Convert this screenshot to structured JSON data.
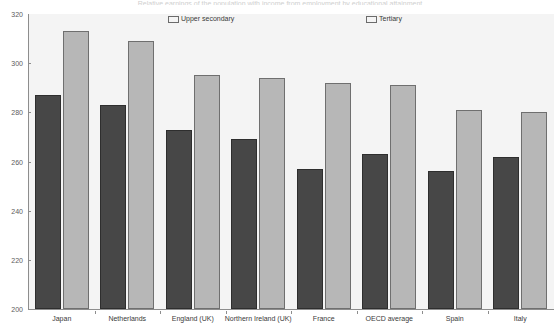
{
  "chart": {
    "title": "Relative earnings of the population with income from employment by educational attainment",
    "legend_position": "top",
    "y_axis": {
      "min": 200,
      "max": 320,
      "step": 20,
      "ticks": [
        200,
        220,
        240,
        260,
        280,
        300,
        320
      ]
    },
    "series_colors": {
      "upper_secondary": "#474747",
      "tertiary": "#b7b7b7"
    },
    "plot_background": "#f4f4f4",
    "axis_color": "#8d8d8d"
  },
  "legend": {
    "items": [
      {
        "label": "Upper secondary",
        "color": "#474747"
      },
      {
        "label": "Tertiary",
        "color": "#b7b7b7"
      }
    ]
  },
  "chart_data": {
    "type": "bar",
    "title": "Relative earnings of the population with income from employment by educational attainment",
    "xlabel": "",
    "ylabel": "",
    "ylim": [
      200,
      320
    ],
    "yticks": [
      200,
      220,
      240,
      260,
      280,
      300,
      320
    ],
    "grid": false,
    "legend_position": "top",
    "categories": [
      "Japan",
      "Netherlands",
      "England (UK)",
      "Northern Ireland (UK)",
      "France",
      "OECD average",
      "Spain",
      "Italy"
    ],
    "series": [
      {
        "name": "Upper secondary",
        "color": "#474747",
        "values": [
          287,
          283,
          273,
          269,
          257,
          263,
          256,
          262
        ]
      },
      {
        "name": "Tertiary",
        "color": "#b7b7b7",
        "values": [
          313,
          309,
          295,
          294,
          292,
          291,
          281,
          280
        ]
      }
    ]
  }
}
